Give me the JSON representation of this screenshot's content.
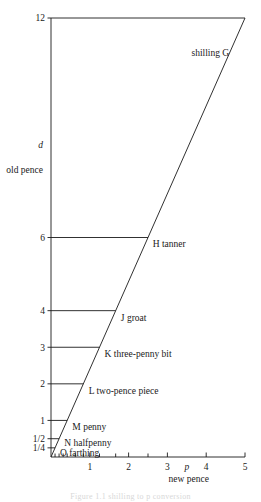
{
  "figure": {
    "caption": "Figure 1.1  shilling to p conversion"
  },
  "chart_data": {
    "type": "line",
    "title": "",
    "xlabel": "new pence",
    "ylabel": "old pence",
    "xsymbol": "p",
    "ysymbol": "d",
    "xlim": [
      0,
      5
    ],
    "ylim": [
      0,
      12
    ],
    "grid": false,
    "legend": "none",
    "x_ticks": [
      {
        "value": 1,
        "label": "1"
      },
      {
        "value": 2,
        "label": "2"
      },
      {
        "value": 3,
        "label": "3"
      },
      {
        "value": 4,
        "label": "4"
      },
      {
        "value": 5,
        "label": "5"
      }
    ],
    "x_minor_ticks": [
      0.104,
      0.208,
      0.3125,
      0.4167,
      0.625,
      0.8333,
      1.25,
      1.6667,
      2.5
    ],
    "y_ticks": [
      {
        "value": 12,
        "label": "12"
      },
      {
        "value": 6,
        "label": "6"
      },
      {
        "value": 4,
        "label": "4"
      },
      {
        "value": 3,
        "label": "3"
      },
      {
        "value": 2,
        "label": "2"
      },
      {
        "value": 1,
        "label": "1"
      },
      {
        "value": 0.5,
        "label": "1/2"
      },
      {
        "value": 0.25,
        "label": "1/4"
      }
    ],
    "series": [
      {
        "name": "conversion",
        "x": [
          0,
          5
        ],
        "y": [
          0,
          12
        ]
      }
    ],
    "annotations": [
      {
        "point": "G",
        "label": "shilling",
        "text": "shilling G",
        "old_pence": 12,
        "new_pence": 5,
        "label_x": 3.62,
        "label_y": 11.05,
        "leader": false
      },
      {
        "point": "H",
        "label": "tanner",
        "text": "H  tanner",
        "old_pence": 6,
        "new_pence": 2.5,
        "label_x": 2.62,
        "label_y": 5.82,
        "leader": true
      },
      {
        "point": "J",
        "label": "groat",
        "text": "J   groat",
        "old_pence": 4,
        "new_pence": 1.6667,
        "label_x": 1.8,
        "label_y": 3.82,
        "leader": true
      },
      {
        "point": "K",
        "label": "three-penny bit",
        "text": "K   three-penny bit",
        "old_pence": 3,
        "new_pence": 1.25,
        "label_x": 1.38,
        "label_y": 2.82,
        "leader": true
      },
      {
        "point": "L",
        "label": "two-pence piece",
        "text": "L   two-pence piece",
        "old_pence": 2,
        "new_pence": 0.8333,
        "label_x": 0.97,
        "label_y": 1.82,
        "leader": true
      },
      {
        "point": "M",
        "label": "penny",
        "text": "M  penny",
        "old_pence": 1,
        "new_pence": 0.4167,
        "label_x": 0.55,
        "label_y": 0.82,
        "leader": true
      },
      {
        "point": "N",
        "label": "halfpenny",
        "text": "N  halfpenny",
        "old_pence": 0.5,
        "new_pence": 0.2083,
        "label_x": 0.34,
        "label_y": 0.4,
        "leader": true
      },
      {
        "point": "O",
        "label": "farthing",
        "text": "O  farthing",
        "old_pence": 0.25,
        "new_pence": 0.1042,
        "label_x": 0.23,
        "label_y": 0.12,
        "leader": true
      }
    ]
  },
  "colors": {
    "line": "#1a1a1a",
    "axis": "#1a1a1a",
    "text": "#1a1a1a",
    "background": "#ffffff"
  }
}
